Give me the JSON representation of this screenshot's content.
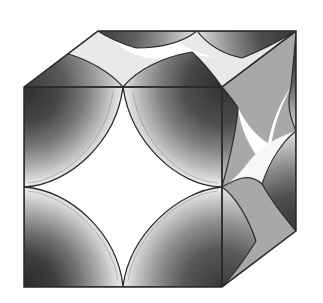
{
  "figure": {
    "title": "Cube with intersecting cylindrical bores",
    "background_color": "#ffffff",
    "outline_color": "#2b2b2b",
    "outline_width": 1.4
  },
  "geometry": {
    "projection": "oblique axonometric",
    "depth_offset": {
      "dx": 74,
      "dy": -56
    },
    "front_face": {
      "name": "front-face",
      "x": 24,
      "y": 87,
      "size": 200,
      "corners": [
        [
          24,
          87
        ],
        [
          222,
          87
        ],
        [
          222,
          287
        ],
        [
          24,
          287
        ]
      ],
      "bore_radius": 99
    },
    "right_face": {
      "name": "right-face",
      "corners": [
        [
          222,
          87
        ],
        [
          296,
          31
        ],
        [
          296,
          231
        ],
        [
          222,
          287
        ]
      ],
      "bore_radius": 99
    },
    "top_face": {
      "name": "top-face",
      "corners": [
        [
          24,
          87
        ],
        [
          98,
          31
        ],
        [
          296,
          31
        ],
        [
          222,
          87
        ]
      ],
      "bore_radius": 99
    }
  },
  "colors": {
    "front_face": "#e3e3e3",
    "front_face_edge": "#dcdcdc",
    "right_face": "#a8a8a8",
    "right_face_edge": "#9e9e9e",
    "top_face": "#e9e9e9",
    "top_face_edge": "#e0e0e0",
    "void_white": "#ffffff",
    "bore_dark": "#3a3a3a",
    "bore_mid": "#8c8c8c",
    "bore_light": "#f2f2f2",
    "outline": "#2b2b2b"
  },
  "faces": [
    {
      "id": "front",
      "label": "Front face",
      "fill": "#e3e3e3",
      "bore_count": 4,
      "void_shape": "astroid"
    },
    {
      "id": "right",
      "label": "Right face",
      "fill": "#a8a8a8",
      "bore_count": 4,
      "void_shape": "sheared astroid"
    },
    {
      "id": "top",
      "label": "Top face",
      "fill": "#e9e9e9",
      "bore_count": 4,
      "void_shape": "sheared astroid"
    }
  ],
  "bores": {
    "count_per_face": 4,
    "shading": "radial gradient, dark at outer rim to light near throat",
    "note": "Quarter-cylinder surfaces carved from each corner of every face"
  }
}
